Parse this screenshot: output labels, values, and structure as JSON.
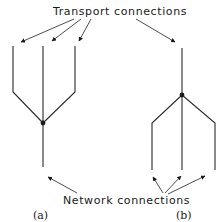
{
  "diagram": {
    "top_label": "Transport connections",
    "bottom_label": "Network connections",
    "captions": {
      "a": "(a)",
      "b": "(b)"
    },
    "colors": {
      "line": "#2a2a2a",
      "node": "#1a1a1a",
      "background": "#ffffff"
    },
    "panel_a": {
      "description": "Three transport connections multiplexed onto one network connection",
      "upper_branches": 3,
      "lower_branches": 1
    },
    "panel_b": {
      "description": "One transport connection split across three network connections",
      "upper_branches": 1,
      "lower_branches": 3
    }
  }
}
